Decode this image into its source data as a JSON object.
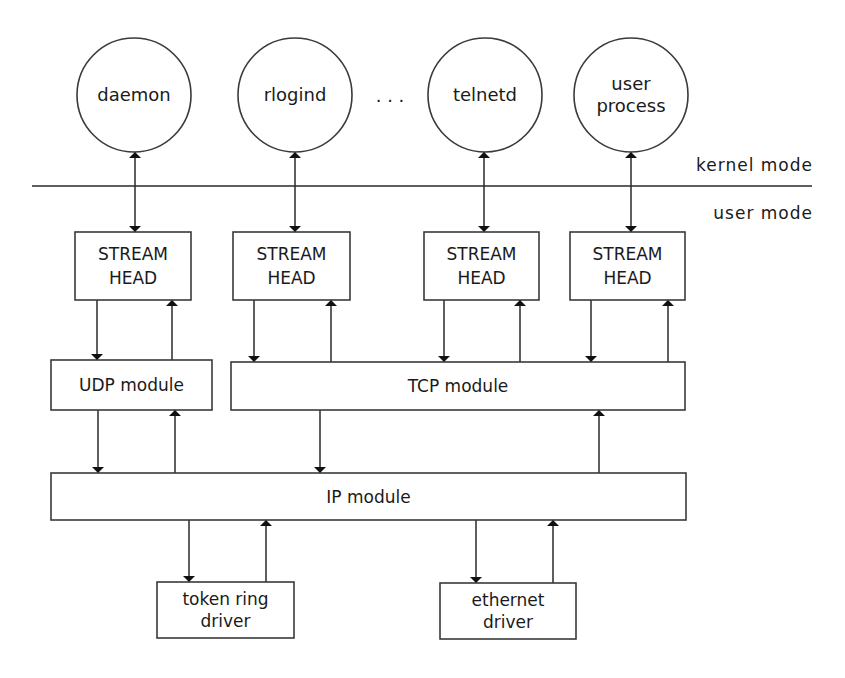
{
  "diagram": {
    "title": "",
    "processes": [
      {
        "id": "daemon",
        "lines": [
          "daemon"
        ],
        "cx": 134,
        "cy": 95,
        "r": 57
      },
      {
        "id": "rlogind",
        "lines": [
          "rlogind"
        ],
        "cx": 295,
        "cy": 95,
        "r": 57
      },
      {
        "id": "telnetd",
        "lines": [
          "telnetd"
        ],
        "cx": 485,
        "cy": 95,
        "r": 57
      },
      {
        "id": "user-process",
        "lines": [
          "user",
          "process"
        ],
        "cx": 631,
        "cy": 95,
        "r": 57
      }
    ],
    "ellipsis": ". . .",
    "divider": {
      "y": 186,
      "x1": 32,
      "x2": 812
    },
    "mode_labels": {
      "kernel": "kernel mode",
      "user": "user mode"
    },
    "stream_heads": [
      {
        "id": "stream-head-1",
        "lines": [
          "STREAM",
          "HEAD"
        ],
        "x": 75,
        "y": 232,
        "w": 116,
        "h": 68
      },
      {
        "id": "stream-head-2",
        "lines": [
          "STREAM",
          "HEAD"
        ],
        "x": 233,
        "y": 232,
        "w": 117,
        "h": 68
      },
      {
        "id": "stream-head-3",
        "lines": [
          "STREAM",
          "HEAD"
        ],
        "x": 424,
        "y": 232,
        "w": 115,
        "h": 68
      },
      {
        "id": "stream-head-4",
        "lines": [
          "STREAM",
          "HEAD"
        ],
        "x": 570,
        "y": 232,
        "w": 115,
        "h": 68
      }
    ],
    "modules": [
      {
        "id": "udp-module",
        "label": "UDP module",
        "x": 51,
        "y": 360,
        "w": 161,
        "h": 50
      },
      {
        "id": "tcp-module",
        "label": "TCP module",
        "x": 231,
        "y": 362,
        "w": 454,
        "h": 48
      },
      {
        "id": "ip-module",
        "label": "IP module",
        "x": 51,
        "y": 473,
        "w": 635,
        "h": 47
      }
    ],
    "drivers": [
      {
        "id": "token-ring-driver",
        "lines": [
          "token ring",
          "driver"
        ],
        "x": 157,
        "y": 582,
        "w": 137,
        "h": 56
      },
      {
        "id": "ethernet-driver",
        "lines": [
          "ethernet",
          "driver"
        ],
        "x": 440,
        "y": 583,
        "w": 136,
        "h": 56
      }
    ],
    "arrows": [
      {
        "from": "daemon",
        "to": "stream-head-1",
        "type": "double",
        "x": 135,
        "y1": 152,
        "y2": 232
      },
      {
        "from": "rlogind",
        "to": "stream-head-2",
        "type": "double",
        "x": 295,
        "y1": 152,
        "y2": 232
      },
      {
        "from": "telnetd",
        "to": "stream-head-3",
        "type": "double",
        "x": 484,
        "y1": 152,
        "y2": 232
      },
      {
        "from": "user-process",
        "to": "stream-head-4",
        "type": "double",
        "x": 631,
        "y1": 152,
        "y2": 232
      },
      {
        "from": "stream-head-1",
        "to": "udp-module",
        "type": "down",
        "x": 97,
        "y1": 300,
        "y2": 360
      },
      {
        "from": "udp-module",
        "to": "stream-head-1",
        "type": "up",
        "x": 172,
        "y1": 360,
        "y2": 300
      },
      {
        "from": "stream-head-2",
        "to": "tcp-module",
        "type": "down",
        "x": 254,
        "y1": 300,
        "y2": 362
      },
      {
        "from": "tcp-module",
        "to": "stream-head-2",
        "type": "up",
        "x": 331,
        "y1": 362,
        "y2": 300
      },
      {
        "from": "stream-head-3",
        "to": "tcp-module",
        "type": "down",
        "x": 444,
        "y1": 300,
        "y2": 362
      },
      {
        "from": "tcp-module",
        "to": "stream-head-3",
        "type": "up",
        "x": 520,
        "y1": 362,
        "y2": 300
      },
      {
        "from": "stream-head-4",
        "to": "tcp-module",
        "type": "down",
        "x": 591,
        "y1": 300,
        "y2": 362
      },
      {
        "from": "tcp-module",
        "to": "stream-head-4",
        "type": "up",
        "x": 668,
        "y1": 362,
        "y2": 300
      },
      {
        "from": "udp-module",
        "to": "ip-module",
        "type": "down",
        "x": 98,
        "y1": 410,
        "y2": 473
      },
      {
        "from": "ip-module",
        "to": "udp-module",
        "type": "up",
        "x": 175,
        "y1": 473,
        "y2": 410
      },
      {
        "from": "tcp-module",
        "to": "ip-module",
        "type": "down",
        "x": 320,
        "y1": 410,
        "y2": 473
      },
      {
        "from": "ip-module",
        "to": "tcp-module",
        "type": "up",
        "x": 599,
        "y1": 473,
        "y2": 410
      },
      {
        "from": "ip-module",
        "to": "token-ring-driver",
        "type": "down",
        "x": 189,
        "y1": 520,
        "y2": 582
      },
      {
        "from": "token-ring-driver",
        "to": "ip-module",
        "type": "up",
        "x": 266,
        "y1": 582,
        "y2": 520
      },
      {
        "from": "ip-module",
        "to": "ethernet-driver",
        "type": "down",
        "x": 476,
        "y1": 520,
        "y2": 583
      },
      {
        "from": "ethernet-driver",
        "to": "ip-module",
        "type": "up",
        "x": 553,
        "y1": 583,
        "y2": 520
      }
    ]
  }
}
